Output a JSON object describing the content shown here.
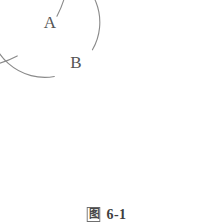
{
  "figure": {
    "caption_prefix": "图",
    "caption_number": "6-1",
    "background_color": "#ffffff",
    "stroke_color": "#8a8a8a",
    "label_color": "#555555"
  },
  "chart_data": {
    "type": "diagram",
    "title": "图 6-1",
    "shapes": [
      {
        "name": "outer-circle",
        "label": "A",
        "cx": 102,
        "cy": 101,
        "r": 96,
        "gap_start_deg": 118,
        "gap_end_deg": 152
      },
      {
        "name": "inner-circle",
        "label": "B",
        "cx": 102,
        "cy": 104,
        "r": 55,
        "gap_start_deg": 100,
        "gap_end_deg": 150
      }
    ],
    "labels": [
      {
        "text": "A",
        "x": 50,
        "y": 28
      },
      {
        "text": "B",
        "x": 76,
        "y": 68
      }
    ]
  }
}
